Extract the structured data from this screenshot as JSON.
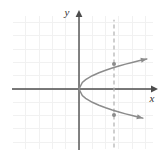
{
  "figure": {
    "name": "sideways-parabola-graph",
    "width": 166,
    "height": 161,
    "background_color": "#ffffff"
  },
  "axes": {
    "x_axis_label": "x",
    "y_axis_label": "y",
    "axis_color": "#4d4d4d",
    "origin_px": {
      "x": 79,
      "y": 89
    },
    "x_axis_span_px": {
      "from": 12,
      "to": 156
    },
    "y_axis_span_px": {
      "from": 11,
      "to": 150
    },
    "arrowheads": [
      "x-positive",
      "y-positive"
    ]
  },
  "grid": {
    "visible": true,
    "color": "#f1f1f1",
    "cell_size_px": 13.3,
    "bounds_px": {
      "left": 13,
      "top": 16,
      "right": 153,
      "bottom": 149
    }
  },
  "chart_data": {
    "type": "line",
    "title": "",
    "xlabel": "x",
    "ylabel": "y",
    "grid": true,
    "legend_position": "none",
    "xlim": [
      -5,
      5.5
    ],
    "ylim": [
      -4.5,
      5.5
    ],
    "series": [
      {
        "name": "parabola-upper-branch",
        "color": "#8c8c8c",
        "equation": "y = sqrt(x)",
        "x": [
          0,
          0.25,
          0.5,
          1,
          1.5,
          2,
          2.5,
          3,
          3.5,
          4,
          4.5,
          5,
          5.1
        ],
        "y": [
          0,
          0.5,
          0.71,
          1,
          1.22,
          1.41,
          1.58,
          1.73,
          1.87,
          2,
          2.12,
          2.24,
          2.26
        ],
        "arrow_end": true
      },
      {
        "name": "parabola-lower-branch",
        "color": "#8c8c8c",
        "equation": "y = -sqrt(x)",
        "x": [
          0,
          0.25,
          0.5,
          1,
          1.5,
          2,
          2.5,
          3,
          3.5,
          4,
          4.5,
          4.8
        ],
        "y": [
          0,
          -0.5,
          -0.71,
          -1,
          -1.22,
          -1.41,
          -1.58,
          -1.73,
          -1.87,
          -2,
          -2.12,
          -2.19
        ],
        "arrow_end": true
      },
      {
        "name": "vertical-dashed-line",
        "color": "#b0b0b0",
        "style": "dashed",
        "x": [
          2.63,
          2.63
        ],
        "y": [
          -4.4,
          5.2
        ]
      }
    ],
    "points": [
      {
        "name": "upper-intersection-point",
        "x": 2.63,
        "y": 1.88,
        "color": "#8c8c8c"
      },
      {
        "name": "lower-intersection-point",
        "x": 2.63,
        "y": -1.95,
        "color": "#8c8c8c"
      },
      {
        "name": "vertex-point",
        "x": 0,
        "y": 0,
        "color": "#8c8c8c"
      }
    ],
    "annotations": []
  },
  "colors": {
    "axis": "#4d4d4d",
    "curve": "#8c8c8c",
    "dashed_line": "#b0b0b0",
    "grid": "#f1f1f1",
    "label_text": "#333333"
  }
}
